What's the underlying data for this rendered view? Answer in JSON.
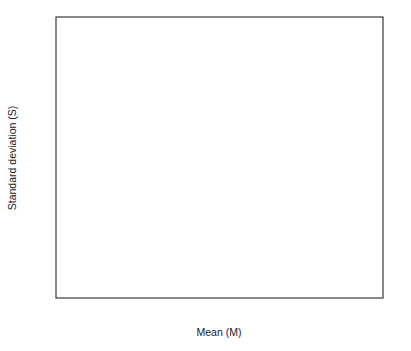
{
  "chart_data": {
    "type": "scatter",
    "title": "",
    "xlabel": "Mean (M)",
    "ylabel": "Standard deviation (S)",
    "xlim": [
      -0.8,
      0.8
    ],
    "ylim": [
      0,
      0.7
    ],
    "xticks": [
      "-.8",
      "-.4",
      "0",
      ".4",
      ".8"
    ],
    "xtick_values": [
      -0.8,
      -0.4,
      0,
      0.4,
      0.8
    ],
    "yticks": [
      "0",
      ".1",
      ".2",
      ".3",
      ".4",
      ".5",
      ".6",
      ".7"
    ],
    "ytick_values": [
      0,
      0.1,
      0.2,
      0.3,
      0.4,
      0.5,
      0.6,
      0.7
    ],
    "grid": "horizontal",
    "legend_position": "inside-bottom-center",
    "marker_style": "letter-codes",
    "fit_curve": {
      "name": "quadratic fit",
      "description": "inverted parabola S = sqrt(M_max^2 - M^2) style envelope",
      "x_start": -0.56,
      "x_end": 0.7,
      "peak_x": 0.06,
      "peak_y": 0.525
    },
    "legend": [
      {
        "symbol": "L",
        "label": "Labor"
      },
      {
        "symbol": "C",
        "label": "Corporate"
      },
      {
        "symbol": "T",
        "label": "Trade"
      },
      {
        "symbol": "N",
        "label": "Unconnected"
      },
      {
        "symbol": "U",
        "label": "Unknown"
      },
      {
        "symbol": "V",
        "label": "Cooperative"
      },
      {
        "symbol": "W",
        "label": "Corporation without Stock"
      }
    ],
    "points": [
      {
        "m": -0.555,
        "s": 0.278,
        "k": "L"
      },
      {
        "m": -0.528,
        "s": 0.262,
        "k": "L"
      },
      {
        "m": -0.512,
        "s": 0.3,
        "k": "L"
      },
      {
        "m": -0.5,
        "s": 0.288,
        "k": "M"
      },
      {
        "m": -0.492,
        "s": 0.315,
        "k": "L"
      },
      {
        "m": -0.485,
        "s": 0.268,
        "k": "L"
      },
      {
        "m": -0.478,
        "s": 0.33,
        "k": "N"
      },
      {
        "m": -0.47,
        "s": 0.305,
        "k": "M"
      },
      {
        "m": -0.466,
        "s": 0.345,
        "k": "L"
      },
      {
        "m": -0.46,
        "s": 0.285,
        "k": "M"
      },
      {
        "m": -0.455,
        "s": 0.32,
        "k": "N"
      },
      {
        "m": -0.45,
        "s": 0.355,
        "k": "L"
      },
      {
        "m": -0.444,
        "s": 0.3,
        "k": "L"
      },
      {
        "m": -0.438,
        "s": 0.338,
        "k": "M"
      },
      {
        "m": -0.432,
        "s": 0.368,
        "k": "L"
      },
      {
        "m": -0.428,
        "s": 0.312,
        "k": "L"
      },
      {
        "m": -0.422,
        "s": 0.352,
        "k": "M"
      },
      {
        "m": -0.418,
        "s": 0.29,
        "k": "L"
      },
      {
        "m": -0.412,
        "s": 0.378,
        "k": "L"
      },
      {
        "m": -0.408,
        "s": 0.335,
        "k": "N"
      },
      {
        "m": -0.402,
        "s": 0.4,
        "k": "L"
      },
      {
        "m": -0.398,
        "s": 0.36,
        "k": "M"
      },
      {
        "m": -0.392,
        "s": 0.322,
        "k": "L"
      },
      {
        "m": -0.386,
        "s": 0.392,
        "k": "L"
      },
      {
        "m": -0.38,
        "s": 0.352,
        "k": "M"
      },
      {
        "m": -0.374,
        "s": 0.412,
        "k": "L"
      },
      {
        "m": -0.368,
        "s": 0.305,
        "k": "L"
      },
      {
        "m": -0.362,
        "s": 0.372,
        "k": "M"
      },
      {
        "m": -0.356,
        "s": 0.418,
        "k": "L"
      },
      {
        "m": -0.35,
        "s": 0.34,
        "k": "T"
      },
      {
        "m": -0.344,
        "s": 0.398,
        "k": "N"
      },
      {
        "m": -0.338,
        "s": 0.43,
        "k": "L"
      },
      {
        "m": -0.332,
        "s": 0.362,
        "k": "M"
      },
      {
        "m": -0.326,
        "s": 0.412,
        "k": "L"
      },
      {
        "m": -0.32,
        "s": 0.448,
        "k": "L"
      },
      {
        "m": -0.314,
        "s": 0.385,
        "k": "M"
      },
      {
        "m": -0.308,
        "s": 0.432,
        "k": "N"
      },
      {
        "m": -0.302,
        "s": 0.355,
        "k": "L"
      },
      {
        "m": -0.296,
        "s": 0.465,
        "k": "L"
      },
      {
        "m": -0.29,
        "s": 0.408,
        "k": "M"
      },
      {
        "m": -0.285,
        "s": 0.442,
        "k": "L"
      },
      {
        "m": -0.28,
        "s": 0.478,
        "k": "T"
      },
      {
        "m": -0.274,
        "s": 0.392,
        "k": "L"
      },
      {
        "m": -0.268,
        "s": 0.455,
        "k": "M"
      },
      {
        "m": -0.262,
        "s": 0.42,
        "k": "L"
      },
      {
        "m": -0.256,
        "s": 0.488,
        "k": "L"
      },
      {
        "m": -0.25,
        "s": 0.372,
        "k": "T"
      },
      {
        "m": -0.245,
        "s": 0.462,
        "k": "M"
      },
      {
        "m": -0.238,
        "s": 0.432,
        "k": "L"
      },
      {
        "m": -0.232,
        "s": 0.495,
        "k": "C"
      },
      {
        "m": -0.226,
        "s": 0.405,
        "k": "M"
      },
      {
        "m": -0.22,
        "s": 0.47,
        "k": "L"
      },
      {
        "m": -0.214,
        "s": 0.448,
        "k": "T"
      },
      {
        "m": -0.208,
        "s": 0.502,
        "k": "C"
      },
      {
        "m": -0.202,
        "s": 0.418,
        "k": "M"
      },
      {
        "m": -0.196,
        "s": 0.478,
        "k": "L"
      },
      {
        "m": -0.19,
        "s": 0.455,
        "k": "T"
      },
      {
        "m": -0.185,
        "s": 0.508,
        "k": "C"
      },
      {
        "m": -0.18,
        "s": 0.432,
        "k": "W"
      },
      {
        "m": -0.174,
        "s": 0.486,
        "k": "C"
      },
      {
        "m": -0.168,
        "s": 0.462,
        "k": "T"
      },
      {
        "m": -0.162,
        "s": 0.512,
        "k": "C"
      },
      {
        "m": -0.156,
        "s": 0.44,
        "k": "M"
      },
      {
        "m": -0.15,
        "s": 0.492,
        "k": "C"
      },
      {
        "m": -0.145,
        "s": 0.468,
        "k": "T"
      },
      {
        "m": -0.14,
        "s": 0.516,
        "k": "C"
      },
      {
        "m": -0.134,
        "s": 0.445,
        "k": "W"
      },
      {
        "m": -0.128,
        "s": 0.498,
        "k": "C"
      },
      {
        "m": -0.122,
        "s": 0.472,
        "k": "C"
      },
      {
        "m": -0.116,
        "s": 0.52,
        "k": "C"
      },
      {
        "m": -0.11,
        "s": 0.452,
        "k": "T"
      },
      {
        "m": -0.105,
        "s": 0.5,
        "k": "C"
      },
      {
        "m": -0.1,
        "s": 0.476,
        "k": "C"
      },
      {
        "m": -0.095,
        "s": 0.524,
        "k": "C"
      },
      {
        "m": -0.09,
        "s": 0.458,
        "k": "M"
      },
      {
        "m": -0.085,
        "s": 0.504,
        "k": "C"
      },
      {
        "m": -0.08,
        "s": 0.48,
        "k": "C"
      },
      {
        "m": -0.075,
        "s": 0.528,
        "k": "C"
      },
      {
        "m": -0.07,
        "s": 0.462,
        "k": "C"
      },
      {
        "m": -0.065,
        "s": 0.508,
        "k": "C"
      },
      {
        "m": -0.06,
        "s": 0.486,
        "k": "C"
      },
      {
        "m": -0.055,
        "s": 0.532,
        "k": "C"
      },
      {
        "m": -0.05,
        "s": 0.466,
        "k": "T"
      },
      {
        "m": -0.045,
        "s": 0.512,
        "k": "C"
      },
      {
        "m": -0.04,
        "s": 0.49,
        "k": "C"
      },
      {
        "m": -0.035,
        "s": 0.536,
        "k": "C"
      },
      {
        "m": -0.03,
        "s": 0.47,
        "k": "C"
      },
      {
        "m": -0.025,
        "s": 0.516,
        "k": "C"
      },
      {
        "m": -0.02,
        "s": 0.494,
        "k": "C"
      },
      {
        "m": -0.015,
        "s": 0.54,
        "k": "C"
      },
      {
        "m": -0.01,
        "s": 0.474,
        "k": "C"
      },
      {
        "m": -0.005,
        "s": 0.52,
        "k": "C"
      },
      {
        "m": 0.0,
        "s": 0.498,
        "k": "C"
      },
      {
        "m": 0.005,
        "s": 0.542,
        "k": "C"
      },
      {
        "m": 0.01,
        "s": 0.478,
        "k": "W"
      },
      {
        "m": 0.015,
        "s": 0.522,
        "k": "C"
      },
      {
        "m": 0.02,
        "s": 0.5,
        "k": "C"
      },
      {
        "m": 0.025,
        "s": 0.545,
        "k": "C"
      },
      {
        "m": 0.03,
        "s": 0.482,
        "k": "C"
      },
      {
        "m": 0.035,
        "s": 0.524,
        "k": "C"
      },
      {
        "m": 0.04,
        "s": 0.502,
        "k": "C"
      },
      {
        "m": 0.045,
        "s": 0.546,
        "k": "C"
      },
      {
        "m": 0.05,
        "s": 0.486,
        "k": "C"
      },
      {
        "m": 0.055,
        "s": 0.526,
        "k": "C"
      },
      {
        "m": 0.06,
        "s": 0.504,
        "k": "C"
      },
      {
        "m": 0.065,
        "s": 0.545,
        "k": "C"
      },
      {
        "m": 0.07,
        "s": 0.488,
        "k": "C"
      },
      {
        "m": 0.075,
        "s": 0.525,
        "k": "C"
      },
      {
        "m": 0.08,
        "s": 0.503,
        "k": "C"
      },
      {
        "m": 0.085,
        "s": 0.543,
        "k": "C"
      },
      {
        "m": 0.09,
        "s": 0.484,
        "k": "T"
      },
      {
        "m": 0.095,
        "s": 0.522,
        "k": "C"
      },
      {
        "m": 0.1,
        "s": 0.5,
        "k": "C"
      },
      {
        "m": 0.106,
        "s": 0.54,
        "k": "C"
      },
      {
        "m": 0.112,
        "s": 0.48,
        "k": "C"
      },
      {
        "m": 0.118,
        "s": 0.518,
        "k": "C"
      },
      {
        "m": 0.124,
        "s": 0.496,
        "k": "C"
      },
      {
        "m": 0.13,
        "s": 0.536,
        "k": "C"
      },
      {
        "m": 0.136,
        "s": 0.474,
        "k": "C"
      },
      {
        "m": 0.142,
        "s": 0.514,
        "k": "C"
      },
      {
        "m": 0.148,
        "s": 0.492,
        "k": "C"
      },
      {
        "m": 0.154,
        "s": 0.532,
        "k": "C"
      },
      {
        "m": 0.16,
        "s": 0.468,
        "k": "T"
      },
      {
        "m": 0.166,
        "s": 0.51,
        "k": "C"
      },
      {
        "m": 0.172,
        "s": 0.488,
        "k": "C"
      },
      {
        "m": 0.178,
        "s": 0.528,
        "k": "C"
      },
      {
        "m": 0.184,
        "s": 0.462,
        "k": "C"
      },
      {
        "m": 0.19,
        "s": 0.506,
        "k": "C"
      },
      {
        "m": 0.196,
        "s": 0.482,
        "k": "C"
      },
      {
        "m": 0.202,
        "s": 0.524,
        "k": "C"
      },
      {
        "m": 0.208,
        "s": 0.456,
        "k": "C"
      },
      {
        "m": 0.214,
        "s": 0.5,
        "k": "C"
      },
      {
        "m": 0.22,
        "s": 0.476,
        "k": "T"
      },
      {
        "m": 0.226,
        "s": 0.518,
        "k": "C"
      },
      {
        "m": 0.232,
        "s": 0.448,
        "k": "C"
      },
      {
        "m": 0.238,
        "s": 0.494,
        "k": "C"
      },
      {
        "m": 0.245,
        "s": 0.47,
        "k": "C"
      },
      {
        "m": 0.252,
        "s": 0.512,
        "k": "C"
      },
      {
        "m": 0.258,
        "s": 0.44,
        "k": "C"
      },
      {
        "m": 0.265,
        "s": 0.488,
        "k": "C"
      },
      {
        "m": 0.272,
        "s": 0.462,
        "k": "T"
      },
      {
        "m": 0.278,
        "s": 0.505,
        "k": "C"
      },
      {
        "m": 0.285,
        "s": 0.432,
        "k": "C"
      },
      {
        "m": 0.292,
        "s": 0.48,
        "k": "C"
      },
      {
        "m": 0.298,
        "s": 0.455,
        "k": "C"
      },
      {
        "m": 0.305,
        "s": 0.498,
        "k": "C"
      },
      {
        "m": 0.312,
        "s": 0.424,
        "k": "V"
      },
      {
        "m": 0.318,
        "s": 0.472,
        "k": "C"
      },
      {
        "m": 0.325,
        "s": 0.446,
        "k": "T"
      },
      {
        "m": 0.332,
        "s": 0.49,
        "k": "C"
      },
      {
        "m": 0.338,
        "s": 0.415,
        "k": "C"
      },
      {
        "m": 0.345,
        "s": 0.464,
        "k": "C"
      },
      {
        "m": 0.352,
        "s": 0.438,
        "k": "T"
      },
      {
        "m": 0.358,
        "s": 0.482,
        "k": "C"
      },
      {
        "m": 0.365,
        "s": 0.405,
        "k": "C"
      },
      {
        "m": 0.372,
        "s": 0.455,
        "k": "T"
      },
      {
        "m": 0.378,
        "s": 0.428,
        "k": "M"
      },
      {
        "m": 0.385,
        "s": 0.472,
        "k": "C"
      },
      {
        "m": 0.392,
        "s": 0.395,
        "k": "C"
      },
      {
        "m": 0.398,
        "s": 0.445,
        "k": "T"
      },
      {
        "m": 0.405,
        "s": 0.418,
        "k": "C"
      },
      {
        "m": 0.412,
        "s": 0.462,
        "k": "T"
      },
      {
        "m": 0.418,
        "s": 0.384,
        "k": "C"
      },
      {
        "m": 0.425,
        "s": 0.434,
        "k": "C"
      },
      {
        "m": 0.432,
        "s": 0.408,
        "k": "T"
      },
      {
        "m": 0.438,
        "s": 0.452,
        "k": "T"
      },
      {
        "m": 0.445,
        "s": 0.372,
        "k": "C"
      },
      {
        "m": 0.452,
        "s": 0.422,
        "k": "C"
      },
      {
        "m": 0.458,
        "s": 0.396,
        "k": "T"
      },
      {
        "m": 0.465,
        "s": 0.44,
        "k": "T"
      },
      {
        "m": 0.472,
        "s": 0.36,
        "k": "C"
      },
      {
        "m": 0.478,
        "s": 0.41,
        "k": "C"
      },
      {
        "m": 0.485,
        "s": 0.384,
        "k": "T"
      },
      {
        "m": 0.492,
        "s": 0.352,
        "k": "C"
      },
      {
        "m": 0.5,
        "s": 0.398,
        "k": "T"
      },
      {
        "m": 0.512,
        "s": 0.372,
        "k": "C"
      },
      {
        "m": 0.525,
        "s": 0.34,
        "k": "C"
      },
      {
        "m": 0.538,
        "s": 0.358,
        "k": "T"
      },
      {
        "m": 0.552,
        "s": 0.325,
        "k": "C"
      },
      {
        "m": 0.568,
        "s": 0.342,
        "k": "T"
      },
      {
        "m": 0.582,
        "s": 0.312,
        "k": "C"
      },
      {
        "m": 0.598,
        "s": 0.298,
        "k": "C"
      },
      {
        "m": 0.612,
        "s": 0.322,
        "k": "C"
      },
      {
        "m": 0.628,
        "s": 0.288,
        "k": "C"
      },
      {
        "m": 0.642,
        "s": 0.305,
        "k": "C"
      },
      {
        "m": 0.655,
        "s": 0.272,
        "k": "C"
      },
      {
        "m": 0.668,
        "s": 0.292,
        "k": "T"
      },
      {
        "m": 0.68,
        "s": 0.258,
        "k": "C"
      },
      {
        "m": 0.692,
        "s": 0.238,
        "k": "T"
      },
      {
        "m": 0.712,
        "s": 0.232,
        "k": "T"
      },
      {
        "m": -0.392,
        "s": 0.252,
        "k": "L"
      },
      {
        "m": -0.352,
        "s": 0.238,
        "k": "L"
      },
      {
        "m": -0.306,
        "s": 0.262,
        "k": "M"
      },
      {
        "m": -0.268,
        "s": 0.246,
        "k": "M"
      },
      {
        "m": -0.222,
        "s": 0.268,
        "k": "L"
      },
      {
        "m": -0.148,
        "s": 0.318,
        "k": "T"
      },
      {
        "m": -0.118,
        "s": 0.302,
        "k": "C"
      },
      {
        "m": -0.062,
        "s": 0.31,
        "k": "M"
      },
      {
        "m": -0.03,
        "s": 0.296,
        "k": "C"
      },
      {
        "m": 0.018,
        "s": 0.312,
        "k": "T"
      },
      {
        "m": 0.098,
        "s": 0.3,
        "k": "C"
      },
      {
        "m": 0.128,
        "s": 0.29,
        "k": "W"
      },
      {
        "m": 0.148,
        "s": 0.305,
        "k": "C"
      },
      {
        "m": 0.205,
        "s": 0.278,
        "k": "T"
      },
      {
        "m": 0.242,
        "s": 0.288,
        "k": "C"
      },
      {
        "m": -0.48,
        "s": 0.392,
        "k": "T"
      },
      {
        "m": -0.298,
        "s": 0.332,
        "k": "T"
      },
      {
        "m": -0.352,
        "s": 0.452,
        "k": "T"
      },
      {
        "m": -0.21,
        "s": 0.552,
        "k": "V"
      },
      {
        "m": -0.052,
        "s": 0.618,
        "k": "C"
      },
      {
        "m": -0.018,
        "s": 0.598,
        "k": "W"
      },
      {
        "m": 0.022,
        "s": 0.602,
        "k": "C"
      },
      {
        "m": 0.042,
        "s": 0.582,
        "k": "T"
      },
      {
        "m": 0.112,
        "s": 0.592,
        "k": "C"
      },
      {
        "m": 0.296,
        "s": 0.588,
        "k": "C"
      },
      {
        "m": -0.132,
        "s": 0.565,
        "k": "C"
      },
      {
        "m": -0.058,
        "s": 0.562,
        "k": "C"
      },
      {
        "m": 0.068,
        "s": 0.568,
        "k": "C"
      },
      {
        "m": 0.172,
        "s": 0.572,
        "k": "C"
      },
      {
        "m": 0.232,
        "s": 0.556,
        "k": "C"
      },
      {
        "m": 0.348,
        "s": 0.538,
        "k": "C"
      },
      {
        "m": 0.392,
        "s": 0.512,
        "k": "C"
      },
      {
        "m": 0.428,
        "s": 0.498,
        "k": "K"
      },
      {
        "m": 0.302,
        "s": 0.52,
        "k": "C"
      },
      {
        "m": 0.262,
        "s": 0.54,
        "k": "C"
      },
      {
        "m": -0.278,
        "s": 0.528,
        "k": "C"
      },
      {
        "m": -0.238,
        "s": 0.548,
        "k": "C"
      },
      {
        "m": 0.552,
        "s": 0.388,
        "k": "T"
      },
      {
        "m": 0.5,
        "s": 0.432,
        "k": "T"
      },
      {
        "m": 0.462,
        "s": 0.468,
        "k": "T"
      },
      {
        "m": 0.422,
        "s": 0.452,
        "k": "T"
      },
      {
        "m": 0.575,
        "s": 0.368,
        "k": "C"
      },
      {
        "m": 0.598,
        "s": 0.348,
        "k": "C"
      },
      {
        "m": 0.455,
        "s": 0.345,
        "k": "C"
      },
      {
        "m": 0.418,
        "s": 0.338,
        "k": "C"
      },
      {
        "m": 0.39,
        "s": 0.36,
        "k": "C"
      },
      {
        "m": 0.368,
        "s": 0.352,
        "k": "C"
      },
      {
        "m": 0.34,
        "s": 0.372,
        "k": "C"
      },
      {
        "m": 0.318,
        "s": 0.385,
        "k": "C"
      },
      {
        "m": 0.645,
        "s": 0.252,
        "k": "C"
      },
      {
        "m": 0.662,
        "s": 0.262,
        "k": "C"
      },
      {
        "m": 0.615,
        "s": 0.268,
        "k": "C"
      }
    ]
  }
}
